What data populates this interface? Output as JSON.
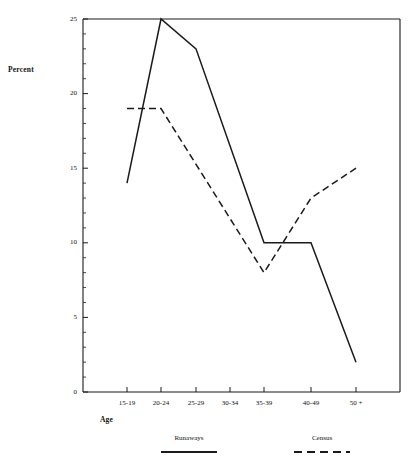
{
  "chart_data": {
    "type": "line",
    "title": "",
    "xlabel": "Age",
    "ylabel": "Percent",
    "categories": [
      "15-19",
      "20-24",
      "25-29",
      "30-34",
      "35-39",
      "40-49",
      "50 +"
    ],
    "ylim": [
      0,
      25
    ],
    "yticks": [
      0,
      5,
      10,
      15,
      20,
      25
    ],
    "ytick_labels": [
      "0",
      "5",
      "10",
      "15",
      "20",
      "25"
    ],
    "y_minor_tick_step": 1,
    "grid": false,
    "legend_position": "below-axes",
    "series": [
      {
        "name": "Runaways",
        "style": "solid",
        "color": "#1a1a1a",
        "values": [
          14,
          25,
          23,
          null,
          10,
          10,
          2
        ]
      },
      {
        "name": "Census",
        "style": "dashed",
        "color": "#1a1a1a",
        "values": [
          19,
          19,
          null,
          null,
          8,
          13,
          15
        ]
      }
    ]
  },
  "axes": {
    "y_title": "Percent",
    "x_title": "Age"
  },
  "legend": {
    "entries": [
      {
        "label": "Runaways",
        "style": "solid"
      },
      {
        "label": "Census",
        "style": "dashed"
      }
    ]
  }
}
